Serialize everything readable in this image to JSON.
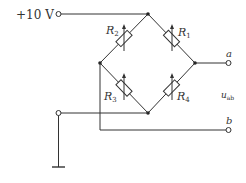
{
  "diagram": {
    "type": "resistive bridge circuit",
    "supply_label": "+10 V",
    "resistors": [
      {
        "id": "R1",
        "label": "R",
        "sub": "1",
        "variable": true
      },
      {
        "id": "R2",
        "label": "R",
        "sub": "2",
        "variable": true
      },
      {
        "id": "R3",
        "label": "R",
        "sub": "3",
        "variable": true
      },
      {
        "id": "R4",
        "label": "R",
        "sub": "4",
        "variable": true
      }
    ],
    "terminals": {
      "a": "a",
      "b": "b"
    },
    "output_label": "u",
    "output_sub": "ab",
    "ground": "ground"
  }
}
